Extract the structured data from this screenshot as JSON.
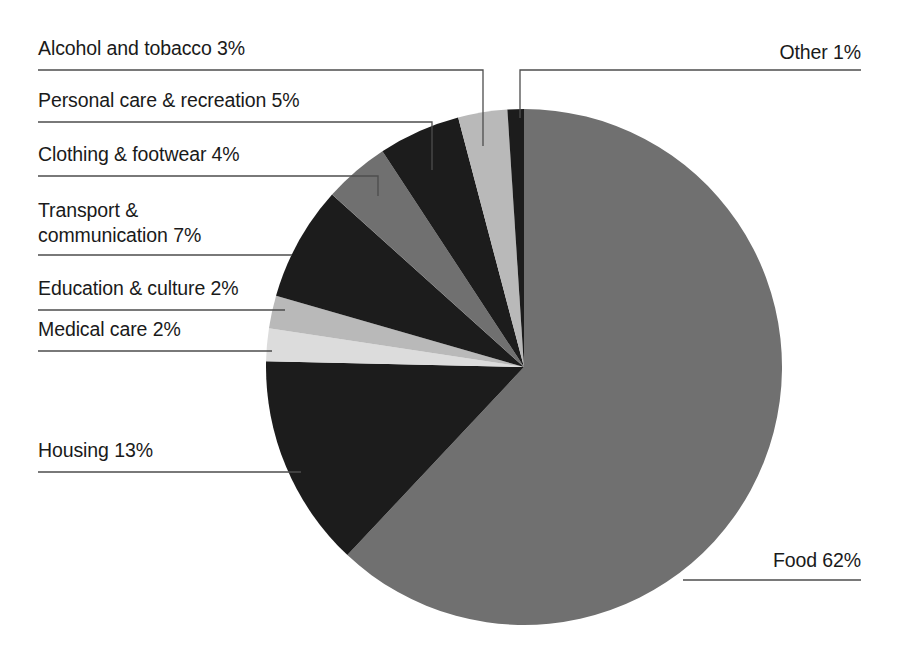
{
  "figure": {
    "title": "",
    "background_color": "#ffffff",
    "text_color": "#1a1a1a",
    "leader_line_color": "#4d4d4d"
  },
  "palette": {
    "black": "#1c1c1c",
    "dark_gray": "#2b2b2b",
    "medium_gray": "#707070",
    "light_gray": "#b9b9b9",
    "pale_gray": "#dcdcdc"
  },
  "chart_data": {
    "type": "pie",
    "title": "",
    "xlabel": "",
    "ylabel": "",
    "legend_position": "none",
    "grid": false,
    "units": "percent",
    "total": 99,
    "start_angle_deg": 0,
    "direction": "clockwise-for-food-counterclockwise-for-rest",
    "categories": [
      "Food",
      "Housing",
      "Transport & communication",
      "Personal care & recreation",
      "Clothing & footwear",
      "Alcohol and tobacco",
      "Education & culture",
      "Medical care",
      "Other"
    ],
    "values": [
      62,
      13,
      7,
      5,
      4,
      3,
      2,
      2,
      1
    ],
    "slices": [
      {
        "label": "Food 62%",
        "name": "Food",
        "value": 62,
        "color": "#707070"
      },
      {
        "label": "Housing 13%",
        "name": "Housing",
        "value": 13,
        "color": "#1c1c1c"
      },
      {
        "label": "Medical care 2%",
        "name": "Medical care",
        "value": 2,
        "color": "#dcdcdc"
      },
      {
        "label": "Education & culture 2%",
        "name": "Education & culture",
        "value": 2,
        "color": "#b9b9b9"
      },
      {
        "label": "Transport &\ncommunication 7%",
        "name": "Transport & communication",
        "value": 7,
        "color": "#1c1c1c"
      },
      {
        "label": "Clothing & footwear 4%",
        "name": "Clothing & footwear",
        "value": 4,
        "color": "#707070"
      },
      {
        "label": "Personal care & recreation 5%",
        "name": "Personal care & recreation",
        "value": 5,
        "color": "#1c1c1c"
      },
      {
        "label": "Alcohol and tobacco 3%",
        "name": "Alcohol and tobacco",
        "value": 3,
        "color": "#b9b9b9"
      },
      {
        "label": "Other 1%",
        "name": "Other",
        "value": 1,
        "color": "#1c1c1c"
      }
    ]
  },
  "labels": {
    "alcohol": "Alcohol and tobacco 3%",
    "personal": "Personal care & recreation 5%",
    "clothing": "Clothing & footwear 4%",
    "transport_l1": "Transport &",
    "transport_l2": "communication 7%",
    "education": "Education & culture 2%",
    "medical": "Medical care 2%",
    "housing": "Housing 13%",
    "other": "Other 1%",
    "food": "Food 62%"
  }
}
